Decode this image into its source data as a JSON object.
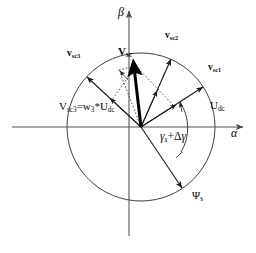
{
  "figure": {
    "type": "vector-space-diagram",
    "background_color": "#ffffff",
    "stroke_color": "#1a1a1a",
    "circle": {
      "cx": 141,
      "cy": 127,
      "r": 74
    },
    "origin": {
      "x": 141,
      "y": 127
    }
  },
  "axes": {
    "beta_label": "β",
    "alpha_label": "α",
    "beta_axis_name": "vertical-beta-axis",
    "alpha_axis_name": "horizontal-alpha-axis"
  },
  "labels": {
    "v_sc": {
      "head": "V",
      "sub": "sc"
    },
    "v_sc1": {
      "head": "v",
      "sub": "sc1"
    },
    "v_sc2": {
      "head": "v",
      "sub": "sc2"
    },
    "v_sc3": {
      "head": "v",
      "sub": "sc3"
    },
    "u_dc": {
      "head": "U",
      "sub": "dc"
    },
    "psi_s": {
      "head": "Ψ",
      "sub": "s"
    },
    "equation": "V_sc3 = w_3 * U_dc",
    "angle": "γ_s + Δγ"
  },
  "equation_parts": {
    "v": "V",
    "v_sub": "sc3",
    "eq": "=w",
    "w_sub": "3",
    "star": "*U",
    "u_sub": "dc"
  },
  "angle_parts": {
    "gamma": "γ",
    "gamma_sub": "s",
    "plus": "+",
    "delta": "Δ",
    "gamma2": "γ"
  },
  "vectors": [
    {
      "name": "v-sc1",
      "label": "v_sc1",
      "angle_deg": 33,
      "length": 74,
      "style": "solid"
    },
    {
      "name": "v-sc2",
      "label": "v_sc2",
      "angle_deg": 66,
      "length": 74,
      "style": "solid"
    },
    {
      "name": "v-sc3",
      "label": "v_sc3",
      "angle_deg": 137,
      "length": 74,
      "style": "solid"
    },
    {
      "name": "v-sc-resultant",
      "label": "v_sc",
      "angle_deg": 76,
      "length": 62,
      "style": "thick"
    },
    {
      "name": "psi-s",
      "label": "psi_s",
      "angle_deg": -56,
      "length": 74,
      "style": "solid"
    }
  ],
  "inner_vectors": [
    {
      "name": "inner-component-1",
      "angle_deg": 33,
      "length": 38
    },
    {
      "name": "inner-component-2",
      "angle_deg": 66,
      "length": 26
    },
    {
      "name": "inner-component-3",
      "angle_deg": 137,
      "length": 40
    }
  ],
  "dotted_construction": {
    "name": "parallelogram-construction",
    "style": "dotted"
  },
  "angle_arc": {
    "name": "gamma-s-plus-delta-gamma-arc",
    "from_deg": -56,
    "to_deg": 33,
    "radius": 47
  }
}
